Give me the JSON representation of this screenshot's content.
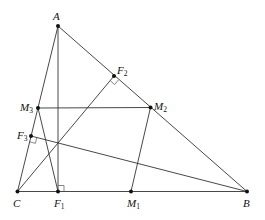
{
  "diagram": {
    "colors": {
      "stroke": "#333333",
      "point": "#111111",
      "thin": "#555555"
    },
    "points": {
      "A": {
        "label": "A",
        "sub": "",
        "x": 58,
        "y": 26
      },
      "B": {
        "label": "B",
        "sub": "",
        "x": 247,
        "y": 191.5
      },
      "C": {
        "label": "C",
        "sub": "",
        "x": 17.5,
        "y": 191.5
      },
      "F1": {
        "label": "F",
        "sub": "1",
        "x": 58,
        "y": 191.5
      },
      "F2": {
        "label": "F",
        "sub": "2",
        "x": 114,
        "y": 76
      },
      "F3": {
        "label": "F",
        "sub": "3",
        "x": 31,
        "y": 136
      },
      "M1": {
        "label": "M",
        "sub": "1",
        "x": 131,
        "y": 191.5
      },
      "M2": {
        "label": "M",
        "sub": "2",
        "x": 150.5,
        "y": 107.5
      },
      "M3": {
        "label": "M",
        "sub": "3",
        "x": 38,
        "y": 108
      }
    },
    "segments": [
      [
        "A",
        "B"
      ],
      [
        "B",
        "C"
      ],
      [
        "C",
        "A"
      ],
      [
        "A",
        "F1"
      ],
      [
        "B",
        "F3"
      ],
      [
        "C",
        "F2"
      ],
      [
        "M3",
        "M2"
      ],
      [
        "M2",
        "M1"
      ],
      [
        "M3",
        "F1"
      ]
    ],
    "right_angles": [
      "F1",
      "F2",
      "F3"
    ],
    "labels": {
      "A": "A",
      "B": "B",
      "C": "C",
      "F1": "F1",
      "F2": "F2",
      "F3": "F3",
      "M1": "M1",
      "M2": "M2",
      "M3": "M3"
    }
  }
}
